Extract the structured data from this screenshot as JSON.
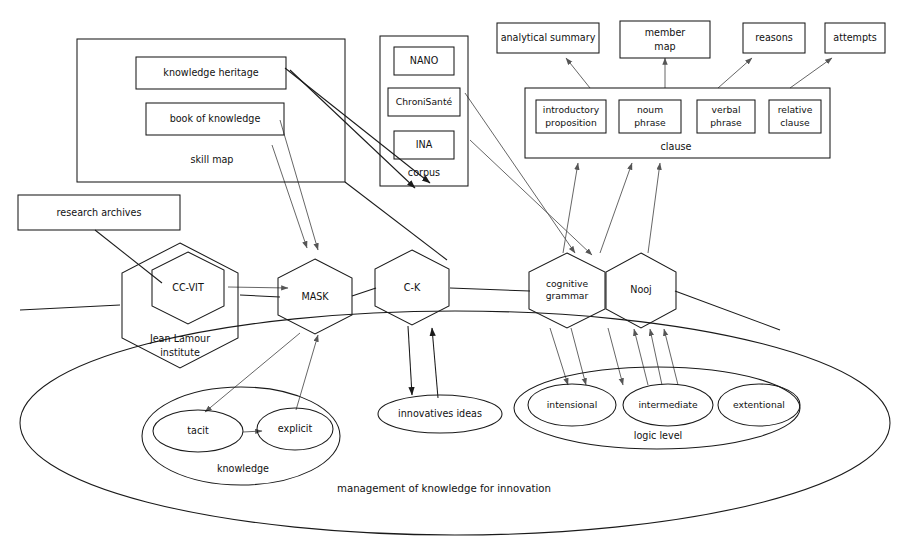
{
  "diagram": {
    "title": "management of knowledge for innovation",
    "colors": {
      "stroke": "#1a1a1a",
      "connector": "#555555",
      "background": "#ffffff"
    },
    "groups": {
      "skill_map": {
        "label": "skill map",
        "items": [
          {
            "label": "knowledge heritage"
          },
          {
            "label": "book of knowledge"
          }
        ]
      },
      "corpus": {
        "label": "corpus",
        "items": [
          {
            "label": "NANO"
          },
          {
            "label": "ChroniSanté"
          },
          {
            "label": "INA"
          }
        ]
      },
      "clause": {
        "label": "clause",
        "items": [
          {
            "label_line1": "introductory",
            "label_line2": "proposition"
          },
          {
            "label_line1": "noum",
            "label_line2": "phrase"
          },
          {
            "label_line1": "verbal",
            "label_line2": "phrase"
          },
          {
            "label_line1": "relative",
            "label_line2": "clause"
          }
        ]
      },
      "knowledge": {
        "label": "knowledge",
        "items": [
          {
            "label": "tacit"
          },
          {
            "label": "explicit"
          }
        ]
      },
      "logic_level": {
        "label": "logic level",
        "items": [
          {
            "label": "intensional"
          },
          {
            "label": "intermediate"
          },
          {
            "label": "extentional"
          }
        ]
      }
    },
    "top_outputs": [
      {
        "label_line1": "analytical summary",
        "label_line2": ""
      },
      {
        "label_line1": "member",
        "label_line2": "map"
      },
      {
        "label_line1": "reasons",
        "label_line2": ""
      },
      {
        "label_line1": "attempts",
        "label_line2": ""
      }
    ],
    "standalone_boxes": [
      {
        "label": "research archives"
      }
    ],
    "hexagons": [
      {
        "label_line1": "Jean Lamour",
        "label_line2": "institute",
        "kind": "outer"
      },
      {
        "label_line1": "CC-VIT",
        "label_line2": "",
        "kind": "inner"
      },
      {
        "label_line1": "MASK",
        "label_line2": "",
        "kind": "method"
      },
      {
        "label_line1": "C-K",
        "label_line2": "",
        "kind": "method"
      },
      {
        "label_line1": "cognitive",
        "label_line2": "grammar",
        "kind": "method"
      },
      {
        "label_line1": "Nooj",
        "label_line2": "",
        "kind": "method"
      }
    ],
    "ellipses": [
      {
        "label": "innovatives ideas"
      }
    ]
  }
}
